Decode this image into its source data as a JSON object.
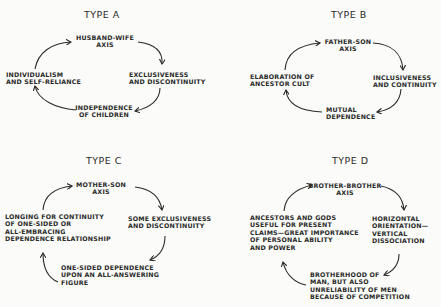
{
  "diagrams": [
    {
      "title": "TYPE A",
      "top": "HUSBAND-WIFE\nAXIS",
      "right": "EXCLUSIVENESS\nAND DISCONTINUITY",
      "bottom": "INDEPENDENCE\nOF CHILDREN",
      "left": "INDIVIDUALISM\nAND SELF-RELIANCE"
    },
    {
      "title": "TYPE B",
      "top": "FATHER-SON\nAXIS",
      "right": "INCLUSIVENESS\nAND CONTINUITY",
      "bottom": "MUTUAL\nDEPENDENCE",
      "left": "ELABORATION OF\nANCESTOR CULT"
    },
    {
      "title": "TYPE C",
      "top": "MOTHER-SON\nAXIS",
      "right": "SOME EXCLUSIVENESS\nAND DISCONTINUITY",
      "bottom": "ONE-SIDED DEPENDENCE\nUPON AN ALL-ANSWERING\nFIGURE",
      "left": "LONGING FOR CONTINUITY\nOF ONE-SIDED OR\nALL-EMBRACING\nDEPENDENCE RELATIONSHIP"
    },
    {
      "title": "TYPE D",
      "top": "BROTHER-BROTHER\nAXIS",
      "right": "HORIZONTAL\nORIENTATION—\nVERTICAL\nDISSOCIATION",
      "bottom": "BROTHERHOOD OF\nMAN, BUT ALSO\nUNRELIABILITY OF MEN\nBECAUSE OF COMPETITION",
      "left": "ANCESTORS AND GODS\nUSEFUL FOR PRESENT\nCLAIMS—GREAT IMPORTANCE\nOF PERSONAL ABILITY\nAND POWER"
    }
  ]
}
